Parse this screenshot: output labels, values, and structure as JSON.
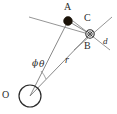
{
  "figure": {
    "type": "geometry-diagram",
    "width": 117,
    "height": 114,
    "background_color": "#ffffff",
    "stroke_color": "#6b6b6b",
    "marker_fill_color": "#1a1208",
    "label_color": "#2b2b2b"
  },
  "labels": {
    "point_a": "A",
    "point_b": "B",
    "point_c": "C",
    "point_o": "O",
    "distance_d": "d",
    "radius_r": "r",
    "angle_theta": "θ",
    "angle_phi": "ϕ"
  },
  "points": [
    {
      "name": "A",
      "x": 68,
      "y": 21,
      "marker": "filled-disc",
      "label_x": 64,
      "label_y": 4
    },
    {
      "name": "B",
      "x": 90,
      "y": 34,
      "marker": "circled-cross",
      "label_x": 84,
      "label_y": 42
    },
    {
      "name": "C",
      "x": 90,
      "y": 34,
      "marker": "circled-cross",
      "label_x": 84,
      "label_y": 14
    },
    {
      "name": "O",
      "x": 30,
      "y": 96,
      "marker": "open-circle",
      "label_x": 3,
      "label_y": 92
    }
  ],
  "segments": [
    {
      "name": "O-A",
      "from": "O",
      "to": "A"
    },
    {
      "name": "O-B",
      "from": "O",
      "to": "B",
      "label": "r"
    },
    {
      "name": "A-B",
      "from": "A",
      "to": "B"
    }
  ],
  "annotations": [
    {
      "name": "r-label",
      "text": "r",
      "x": 65,
      "y": 57
    },
    {
      "name": "d-label",
      "text": "d",
      "x": 103,
      "y": 37
    },
    {
      "name": "theta-label",
      "text": "θ",
      "x": 38,
      "y": 60
    },
    {
      "name": "phi-label",
      "text": "ϕ",
      "x": 33,
      "y": 60
    }
  ]
}
